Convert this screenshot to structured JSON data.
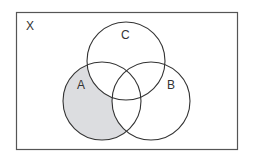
{
  "diagram": {
    "type": "venn",
    "universe_label": "X",
    "sets": [
      {
        "name": "A",
        "label": "A"
      },
      {
        "name": "B",
        "label": "B"
      },
      {
        "name": "C",
        "label": "C"
      }
    ],
    "shaded_region": "A only (A ∩ B' ∩ C')",
    "colors": {
      "stroke": "#333333",
      "shade": "#dcdde0",
      "border": "#555555",
      "background": "#ffffff"
    }
  }
}
